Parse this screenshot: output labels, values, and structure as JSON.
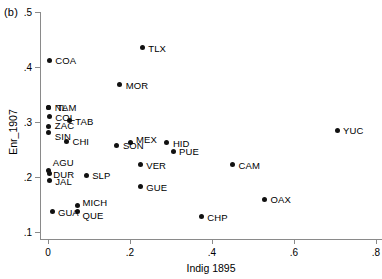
{
  "panel": {
    "tag": "(b)"
  },
  "chart_data": {
    "type": "scatter",
    "title": "",
    "xlabel": "Indig 1895",
    "ylabel": "Enr_1907",
    "xlim": [
      -0.03,
      0.81
    ],
    "ylim": [
      0.095,
      0.5
    ],
    "xticks": [
      "0",
      ".2",
      ".4",
      ".6",
      ".8"
    ],
    "xtickvalues": [
      0,
      0.2,
      0.4,
      0.6,
      0.8
    ],
    "yticks": [
      ".1",
      ".2",
      ".3",
      ".4",
      ".5"
    ],
    "ytickvalues": [
      0.1,
      0.2,
      0.3,
      0.4,
      0.5
    ],
    "grid": false,
    "legend": "none",
    "points": [
      {
        "label": "TLX",
        "x": 0.23,
        "y": 0.435,
        "lx": 6,
        "ly": 0
      },
      {
        "label": "COA",
        "x": 0.003,
        "y": 0.412,
        "lx": 6,
        "ly": 0
      },
      {
        "label": "MOR",
        "x": 0.175,
        "y": 0.368,
        "lx": 6,
        "ly": 0
      },
      {
        "label": "NL",
        "x": 0.002,
        "y": 0.327,
        "lx": 6,
        "ly": 0
      },
      {
        "label": "TAM",
        "x": 0.002,
        "y": 0.327,
        "lx": 8,
        "ly": 0
      },
      {
        "label": "COL",
        "x": 0.003,
        "y": 0.31,
        "lx": 6,
        "ly": 0
      },
      {
        "label": "TAB",
        "x": 0.052,
        "y": 0.302,
        "lx": 6,
        "ly": 0
      },
      {
        "label": "ZAC",
        "x": 0.002,
        "y": 0.291,
        "lx": 6,
        "ly": -2
      },
      {
        "label": "SIN",
        "x": 0.002,
        "y": 0.281,
        "lx": 6,
        "ly": 4
      },
      {
        "label": "YUC",
        "x": 0.705,
        "y": 0.285,
        "lx": 6,
        "ly": 0
      },
      {
        "label": "CHI",
        "x": 0.045,
        "y": 0.265,
        "lx": 6,
        "ly": 0
      },
      {
        "label": "MEX",
        "x": 0.2,
        "y": 0.262,
        "lx": 6,
        "ly": -4
      },
      {
        "label": "SON",
        "x": 0.168,
        "y": 0.258,
        "lx": 6,
        "ly": 0
      },
      {
        "label": "HID",
        "x": 0.29,
        "y": 0.262,
        "lx": 6,
        "ly": 0
      },
      {
        "label": "PUE",
        "x": 0.305,
        "y": 0.247,
        "lx": 6,
        "ly": 0
      },
      {
        "label": "CAM",
        "x": 0.45,
        "y": 0.222,
        "lx": 6,
        "ly": 0
      },
      {
        "label": "VER",
        "x": 0.225,
        "y": 0.222,
        "lx": 6,
        "ly": 0
      },
      {
        "label": "AGU",
        "x": 0.002,
        "y": 0.212,
        "lx": 4,
        "ly": -8
      },
      {
        "label": "DUR",
        "x": 0.003,
        "y": 0.206,
        "lx": 4,
        "ly": 0
      },
      {
        "label": "SLP",
        "x": 0.093,
        "y": 0.203,
        "lx": 6,
        "ly": 0
      },
      {
        "label": "JAL",
        "x": 0.003,
        "y": 0.193,
        "lx": 6,
        "ly": 0
      },
      {
        "label": "GUE",
        "x": 0.225,
        "y": 0.182,
        "lx": 6,
        "ly": 0
      },
      {
        "label": "OAX",
        "x": 0.528,
        "y": 0.16,
        "lx": 6,
        "ly": 0
      },
      {
        "label": "MICH",
        "x": 0.072,
        "y": 0.148,
        "lx": 5,
        "ly": -4
      },
      {
        "label": "QUE",
        "x": 0.072,
        "y": 0.138,
        "lx": 5,
        "ly": 4
      },
      {
        "label": "GUA",
        "x": 0.012,
        "y": 0.137,
        "lx": 5,
        "ly": 0
      },
      {
        "label": "CHP",
        "x": 0.374,
        "y": 0.128,
        "lx": 6,
        "ly": 0
      }
    ]
  }
}
